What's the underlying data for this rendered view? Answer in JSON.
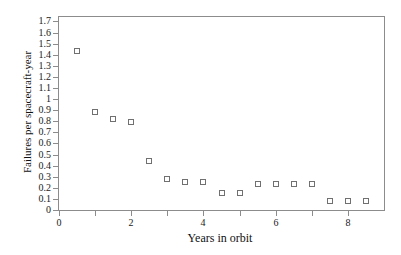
{
  "chart_data": {
    "type": "scatter",
    "title": "",
    "xlabel": "Years in orbit",
    "ylabel": "Failures per spacecraft-year",
    "marker": "open-square",
    "marker_color": "#707070",
    "axis_color": "#8c8c8c",
    "background_color": "#ffffff",
    "grid": false,
    "legend": "none",
    "xlim": [
      0,
      9
    ],
    "ylim": [
      0,
      1.74
    ],
    "x": [
      0.5,
      1.0,
      1.5,
      2.0,
      2.5,
      3.0,
      3.5,
      4.0,
      4.5,
      5.0,
      5.5,
      6.0,
      6.5,
      7.0,
      7.5,
      8.0,
      8.5
    ],
    "y": [
      1.43,
      0.88,
      0.82,
      0.79,
      0.44,
      0.28,
      0.25,
      0.25,
      0.15,
      0.15,
      0.23,
      0.23,
      0.23,
      0.23,
      0.08,
      0.08,
      0.08
    ],
    "x_tick_values": [
      0,
      1,
      2,
      3,
      4,
      5,
      6,
      7,
      8
    ],
    "x_tick_labels": [
      "0",
      "",
      "2",
      "",
      "4",
      "",
      "6",
      "",
      "8"
    ],
    "y_tick_values": [
      0,
      0.1,
      0.2,
      0.3,
      0.4,
      0.5,
      0.6,
      0.7,
      0.8,
      0.9,
      1.0,
      1.1,
      1.2,
      1.3,
      1.4,
      1.5,
      1.6,
      1.7
    ],
    "y_tick_labels": [
      "0",
      "0.1",
      "0.2",
      "0.3",
      "0.4",
      "0.5",
      "0.6",
      "0.7",
      "0.8",
      "0.9",
      "1",
      "1.1",
      "1.2",
      "1.3",
      "1.4",
      "1.5",
      "1.6",
      "1.7"
    ]
  }
}
